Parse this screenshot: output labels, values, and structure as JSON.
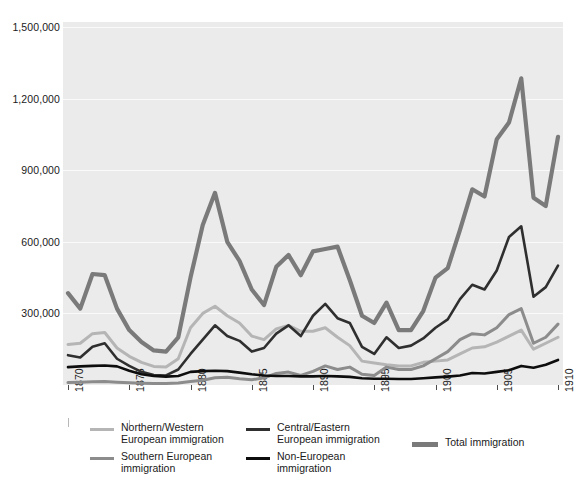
{
  "chart_data": {
    "type": "line",
    "title": "",
    "subtitle": "",
    "xlabel": "",
    "ylabel": "",
    "xlim": [
      1870,
      1910
    ],
    "ylim": [
      0,
      1500000
    ],
    "grid": true,
    "legend_position": "bottom",
    "y_ticks": [
      "1,500,000",
      "1,200,000",
      "900,000",
      "600,000",
      "300,000"
    ],
    "y_tick_values": [
      1500000,
      1200000,
      900000,
      600000,
      300000
    ],
    "x_ticks": [
      "1870",
      "1875",
      "1880",
      "1885",
      "1890",
      "1895",
      "1900",
      "1905",
      "1910"
    ],
    "x_tick_values": [
      1870,
      1875,
      1880,
      1885,
      1890,
      1895,
      1900,
      1905,
      1910
    ],
    "x": [
      1870,
      1871,
      1872,
      1873,
      1874,
      1875,
      1876,
      1877,
      1878,
      1879,
      1880,
      1881,
      1882,
      1883,
      1884,
      1885,
      1886,
      1887,
      1888,
      1889,
      1890,
      1891,
      1892,
      1893,
      1894,
      1895,
      1896,
      1897,
      1898,
      1899,
      1900,
      1901,
      1902,
      1903,
      1904,
      1905,
      1906,
      1907,
      1908,
      1909,
      1910
    ],
    "series": [
      {
        "name": "Northern/Western European immigration",
        "color": "#b5b5b5",
        "width": 3,
        "values": [
          170000,
          175000,
          215000,
          220000,
          155000,
          120000,
          95000,
          78000,
          75000,
          110000,
          240000,
          300000,
          330000,
          290000,
          260000,
          205000,
          190000,
          235000,
          250000,
          225000,
          225000,
          240000,
          200000,
          165000,
          100000,
          92000,
          85000,
          80000,
          80000,
          95000,
          100000,
          105000,
          130000,
          155000,
          160000,
          180000,
          205000,
          230000,
          150000,
          175000,
          200000
        ]
      },
      {
        "name": "Southern European immigration",
        "color": "#8c8c8c",
        "width": 3,
        "values": [
          10000,
          12000,
          14000,
          15000,
          12000,
          9000,
          7000,
          6000,
          6000,
          8000,
          15000,
          20000,
          30000,
          32000,
          26000,
          22000,
          30000,
          48000,
          54000,
          40000,
          57000,
          80000,
          65000,
          75000,
          45000,
          40000,
          75000,
          65000,
          65000,
          80000,
          110000,
          140000,
          190000,
          215000,
          210000,
          240000,
          295000,
          320000,
          175000,
          200000,
          255000
        ]
      },
      {
        "name": "Central/Eastern European immigration",
        "color": "#2f2f2f",
        "width": 2.6,
        "values": [
          125000,
          115000,
          160000,
          175000,
          110000,
          80000,
          55000,
          42000,
          40000,
          65000,
          130000,
          190000,
          250000,
          205000,
          185000,
          140000,
          155000,
          215000,
          250000,
          205000,
          290000,
          340000,
          280000,
          260000,
          160000,
          130000,
          200000,
          155000,
          165000,
          195000,
          240000,
          275000,
          360000,
          420000,
          400000,
          480000,
          620000,
          665000,
          370000,
          410000,
          500000
        ]
      },
      {
        "name": "Non-European immigration",
        "color": "#0d0d0d",
        "width": 2.6,
        "values": [
          75000,
          78000,
          80000,
          82000,
          78000,
          60000,
          45000,
          38000,
          35000,
          38000,
          55000,
          58000,
          60000,
          58000,
          52000,
          45000,
          40000,
          38000,
          38000,
          36000,
          36000,
          38000,
          36000,
          34000,
          28000,
          26000,
          26000,
          25000,
          25000,
          28000,
          32000,
          35000,
          40000,
          50000,
          48000,
          55000,
          62000,
          80000,
          72000,
          85000,
          105000
        ]
      },
      {
        "name": "Total immigration",
        "color": "#7a7a7a",
        "width": 4.2,
        "values": [
          385000,
          320000,
          465000,
          460000,
          320000,
          230000,
          180000,
          145000,
          140000,
          200000,
          450000,
          670000,
          805000,
          600000,
          520000,
          400000,
          335000,
          495000,
          545000,
          460000,
          560000,
          570000,
          580000,
          440000,
          290000,
          260000,
          345000,
          230000,
          230000,
          310000,
          450000,
          490000,
          650000,
          820000,
          790000,
          1030000,
          1100000,
          1285000,
          785000,
          750000,
          1040000
        ]
      }
    ]
  },
  "axis": {
    "y_ticks": [
      {
        "label": "1,500,000",
        "value": 1500000
      },
      {
        "label": "1,200,000",
        "value": 1200000
      },
      {
        "label": "900,000",
        "value": 900000
      },
      {
        "label": "600,000",
        "value": 600000
      },
      {
        "label": "300,000",
        "value": 300000
      }
    ],
    "x_ticks": [
      {
        "label": "1870",
        "value": 1870
      },
      {
        "label": "1875",
        "value": 1875
      },
      {
        "label": "1880",
        "value": 1880
      },
      {
        "label": "1885",
        "value": 1885
      },
      {
        "label": "1890",
        "value": 1890
      },
      {
        "label": "1895",
        "value": 1895
      },
      {
        "label": "1900",
        "value": 1900
      },
      {
        "label": "1905",
        "value": 1905
      },
      {
        "label": "1910",
        "value": 1910
      }
    ]
  },
  "legend": {
    "items": [
      {
        "label": "Northern/Western\nEuropean immigration",
        "color": "#b5b5b5",
        "thick": false
      },
      {
        "label": "Southern European\nimmigration",
        "color": "#8c8c8c",
        "thick": false
      },
      {
        "label": "Central/Eastern\nEuropean immigration",
        "color": "#2f2f2f",
        "thick": false
      },
      {
        "label": "Non-European\nimmigration",
        "color": "#0d0d0d",
        "thick": false
      },
      {
        "label": "Total immigration",
        "color": "#7a7a7a",
        "thick": true
      }
    ]
  },
  "colors": {
    "plot_background": "#ebebeb",
    "page_background": "#ffffff",
    "gridline": "#fafafa",
    "text": "#1a1a1a",
    "tick": "#4d4d4d"
  }
}
